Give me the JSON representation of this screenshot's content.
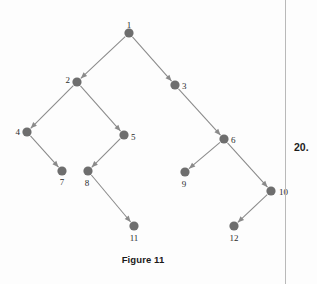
{
  "figure": {
    "caption": "Figure 11",
    "background_color": "#fdfdfd",
    "node_color": "#6e6e6e",
    "edge_color": "#8a8a8a",
    "label_color": "#2b2b2b",
    "node_radius": 4.6,
    "nodes": [
      {
        "id": "1",
        "label": "1",
        "x": 129,
        "y": 33,
        "label_dx": 0,
        "label_dy": -7,
        "label_anchor": "middle"
      },
      {
        "id": "2",
        "label": "2",
        "x": 77,
        "y": 82,
        "label_dx": -7,
        "label_dy": -1,
        "label_anchor": "end"
      },
      {
        "id": "3",
        "label": "3",
        "x": 175,
        "y": 85,
        "label_dx": 7,
        "label_dy": 2,
        "label_anchor": "start"
      },
      {
        "id": "4",
        "label": "4",
        "x": 27,
        "y": 132,
        "label_dx": -7,
        "label_dy": 1,
        "label_anchor": "end"
      },
      {
        "id": "5",
        "label": "5",
        "x": 124,
        "y": 135,
        "label_dx": 7,
        "label_dy": 3,
        "label_anchor": "start"
      },
      {
        "id": "6",
        "label": "6",
        "x": 224,
        "y": 139,
        "label_dx": 7,
        "label_dy": 2,
        "label_anchor": "start"
      },
      {
        "id": "7",
        "label": "7",
        "x": 62,
        "y": 171,
        "label_dx": 0,
        "label_dy": 12,
        "label_anchor": "middle"
      },
      {
        "id": "8",
        "label": "8",
        "x": 88,
        "y": 171,
        "label_dx": -1,
        "label_dy": 13,
        "label_anchor": "middle"
      },
      {
        "id": "9",
        "label": "9",
        "x": 185,
        "y": 172,
        "label_dx": -1,
        "label_dy": 13,
        "label_anchor": "middle"
      },
      {
        "id": "10",
        "label": "10",
        "x": 271,
        "y": 191,
        "label_dx": 8,
        "label_dy": 2,
        "label_anchor": "start"
      },
      {
        "id": "11",
        "label": "11",
        "x": 134,
        "y": 226,
        "label_dx": 0,
        "label_dy": 13,
        "label_anchor": "middle"
      },
      {
        "id": "12",
        "label": "12",
        "x": 234,
        "y": 226,
        "label_dx": 0,
        "label_dy": 13,
        "label_anchor": "middle"
      }
    ],
    "edges": [
      {
        "from": "1",
        "to": "2",
        "directed": true
      },
      {
        "from": "1",
        "to": "3",
        "directed": true
      },
      {
        "from": "2",
        "to": "4",
        "directed": true
      },
      {
        "from": "2",
        "to": "5",
        "directed": true
      },
      {
        "from": "4",
        "to": "7",
        "directed": true
      },
      {
        "from": "5",
        "to": "8",
        "directed": true
      },
      {
        "from": "3",
        "to": "6",
        "directed": true
      },
      {
        "from": "6",
        "to": "9",
        "directed": true
      },
      {
        "from": "6",
        "to": "10",
        "directed": true
      },
      {
        "from": "8",
        "to": "11",
        "directed": true
      },
      {
        "from": "10",
        "to": "12",
        "directed": true
      }
    ]
  },
  "margin": {
    "exercise_number": "20."
  }
}
